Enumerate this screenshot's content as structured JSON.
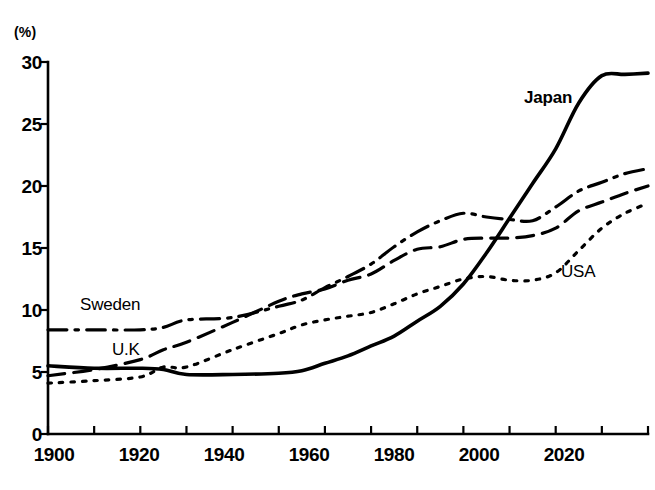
{
  "chart_data": {
    "type": "line",
    "title": "",
    "subtitle": "",
    "xlabel": "",
    "ylabel": "",
    "unit_label": "(%)",
    "xlim": [
      1900,
      2030
    ],
    "ylim": [
      0,
      30
    ],
    "grid": false,
    "legend_position": "inline-annotations",
    "x_ticks": [
      1900,
      1910,
      1920,
      1930,
      1940,
      1950,
      1960,
      1970,
      1980,
      1990,
      2000,
      2010,
      2020,
      2030
    ],
    "x_tick_labels": [
      "1900",
      "1920",
      "1940",
      "1960",
      "1980",
      "2000",
      "2020"
    ],
    "x_tick_label_values": [
      1900,
      1920,
      1940,
      1960,
      1980,
      2000,
      2020
    ],
    "y_ticks": [
      0,
      5,
      10,
      15,
      20,
      25,
      30
    ],
    "y_tick_labels": [
      "0",
      "5",
      "10",
      "15",
      "20",
      "25",
      "30"
    ],
    "x": [
      1900,
      1910,
      1920,
      1925,
      1930,
      1940,
      1950,
      1955,
      1960,
      1965,
      1970,
      1975,
      1980,
      1985,
      1990,
      1995,
      2000,
      2005,
      2010,
      2015,
      2020,
      2025,
      2030
    ],
    "series": [
      {
        "name": "Japan",
        "label": "Japan",
        "style": "solid",
        "emphasis": "bold",
        "values": [
          5.5,
          5.3,
          5.3,
          5.2,
          4.8,
          4.8,
          4.9,
          5.1,
          5.7,
          6.3,
          7.1,
          7.9,
          9.1,
          10.3,
          12.1,
          14.6,
          17.4,
          20.2,
          23.0,
          26.7,
          28.9,
          29.0,
          29.1
        ]
      },
      {
        "name": "Sweden",
        "label": "Sweden",
        "style": "dash-dot",
        "emphasis": "normal",
        "values": [
          8.4,
          8.4,
          8.4,
          8.6,
          9.2,
          9.4,
          10.3,
          10.8,
          11.8,
          12.7,
          13.7,
          15.1,
          16.3,
          17.2,
          17.8,
          17.5,
          17.3,
          17.2,
          18.3,
          19.6,
          20.3,
          21.0,
          21.4
        ]
      },
      {
        "name": "U.K",
        "label": "U.K",
        "style": "dashed",
        "emphasis": "normal",
        "values": [
          4.7,
          5.2,
          6.0,
          6.8,
          7.4,
          9.0,
          10.7,
          11.3,
          11.7,
          12.4,
          12.9,
          14.0,
          14.9,
          15.1,
          15.7,
          15.8,
          15.8,
          16.0,
          16.6,
          18.0,
          18.7,
          19.4,
          20.0
        ]
      },
      {
        "name": "USA",
        "label": "USA",
        "style": "dotted",
        "emphasis": "normal",
        "values": [
          4.1,
          4.3,
          4.6,
          5.4,
          5.4,
          6.8,
          8.1,
          8.8,
          9.2,
          9.5,
          9.8,
          10.5,
          11.3,
          11.9,
          12.5,
          12.7,
          12.4,
          12.4,
          13.0,
          14.8,
          16.6,
          17.8,
          18.6
        ]
      }
    ],
    "annotations": [
      {
        "text": "Japan",
        "series": "Japan",
        "x": 2022,
        "y": 27.5
      },
      {
        "text": "Sweden",
        "series": "Sweden",
        "x": 1913,
        "y": 10.4
      },
      {
        "text": "U.K",
        "series": "U.K",
        "x": 1922,
        "y": 6.6
      },
      {
        "text": "USA",
        "series": "USA",
        "x": 2018,
        "y": 12.9
      }
    ]
  },
  "axes": {
    "unit_label": "(%)",
    "y_labels": [
      "30",
      "25",
      "20",
      "15",
      "10",
      "5",
      "0"
    ],
    "x_labels": [
      "1900",
      "1920",
      "1940",
      "1960",
      "1980",
      "2000",
      "2020"
    ]
  },
  "labels": {
    "japan": "Japan",
    "sweden": "Sweden",
    "uk": "U.K",
    "usa": "USA"
  },
  "colors": {
    "ink": "#000000",
    "background": "#ffffff"
  }
}
